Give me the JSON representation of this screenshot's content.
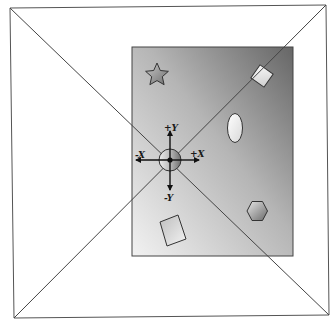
{
  "diagram": {
    "type": "perspective-coordinate-illustration",
    "canvas": {
      "width": 336,
      "height": 325,
      "background": "#ffffff"
    },
    "outer_frame": {
      "corners": [
        [
          10,
          8
        ],
        [
          326,
          5
        ],
        [
          329,
          315
        ],
        [
          14,
          318
        ]
      ],
      "stroke": "#555555"
    },
    "panel": {
      "x": 132,
      "y": 47,
      "width": 161,
      "height": 209,
      "gradient_from": "#6b6b6b",
      "gradient_to": "#f0f0f0",
      "stroke": "#444444"
    },
    "axes": {
      "origin": [
        170,
        160
      ],
      "labels": {
        "pos_y": "+Y",
        "neg_y": "-Y",
        "pos_x": "+X",
        "neg_x": "-X"
      }
    },
    "shapes": [
      {
        "name": "star",
        "cx": 157,
        "cy": 75
      },
      {
        "name": "rotated-square",
        "cx": 262,
        "cy": 76
      },
      {
        "name": "ellipse",
        "cx": 235,
        "cy": 128
      },
      {
        "name": "hexagon",
        "cx": 257,
        "cy": 211
      },
      {
        "name": "rectangle",
        "cx": 173,
        "cy": 230
      }
    ]
  }
}
